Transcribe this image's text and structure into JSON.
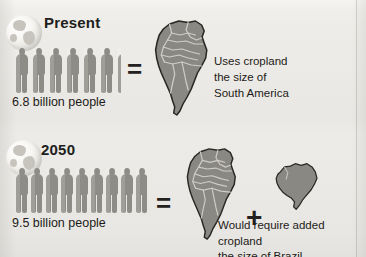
{
  "graphic": {
    "background_color": "#edebe7",
    "figure_color": "#8e8c86",
    "map_fill_color": "#8a8882",
    "map_outline_color": "#2a2825",
    "map_border_color": "#cfcdc6",
    "text_color": "#1d1b19"
  },
  "rows": [
    {
      "heading": "Present",
      "globe_icon": "globe-americas-icon",
      "people_label": "6.8 billion people",
      "people_count": 6.8,
      "people_full_figures": 6,
      "people_partial_fraction": 0.8,
      "equals_symbol": "=",
      "maps": [
        {
          "name": "south-america-map",
          "label": "South America"
        }
      ],
      "callout": "Uses cropland\nthe size of\nSouth America"
    },
    {
      "heading": "2050",
      "globe_icon": "globe-americas-icon",
      "people_label": "9.5 billion people",
      "people_count": 9.5,
      "people_full_figures": 9,
      "people_partial_fraction": 0.5,
      "equals_symbol": "=",
      "plus_symbol": "+",
      "maps": [
        {
          "name": "south-america-map",
          "label": "South America"
        },
        {
          "name": "brazil-map",
          "label": "Brazil"
        }
      ],
      "callout": "Would require added cropland\nthe size of Brazil"
    }
  ]
}
